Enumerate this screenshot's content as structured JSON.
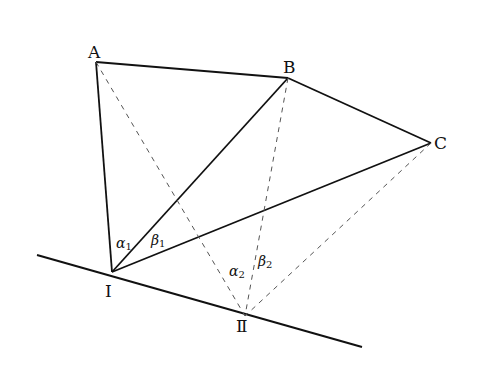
{
  "diagram": {
    "type": "geometry",
    "stroke_color": "#111111",
    "dashed_color": "#555555",
    "points": {
      "A": {
        "label": "A",
        "x": 96,
        "y": 62
      },
      "B": {
        "label": "B",
        "x": 288,
        "y": 78
      },
      "C": {
        "label": "C",
        "x": 431,
        "y": 143
      },
      "I": {
        "label": "I",
        "x": 112,
        "y": 272
      },
      "II": {
        "label": "Ⅱ",
        "x": 245,
        "y": 316
      }
    },
    "baseline": {
      "x1": 37,
      "y1": 255,
      "x2": 362,
      "y2": 347
    },
    "solid_segments": [
      [
        "A",
        "B"
      ],
      [
        "B",
        "C"
      ],
      [
        "A",
        "I"
      ],
      [
        "B",
        "I"
      ],
      [
        "C",
        "I"
      ]
    ],
    "dashed_segments": [
      [
        "A",
        "II"
      ],
      [
        "B",
        "II"
      ],
      [
        "C",
        "II"
      ]
    ],
    "angles": {
      "alpha1": {
        "sym": "α",
        "sub": "1"
      },
      "beta1": {
        "sym": "β",
        "sub": "1"
      },
      "alpha2": {
        "sym": "α",
        "sub": "2"
      },
      "beta2": {
        "sym": "β",
        "sub": "2"
      }
    }
  }
}
